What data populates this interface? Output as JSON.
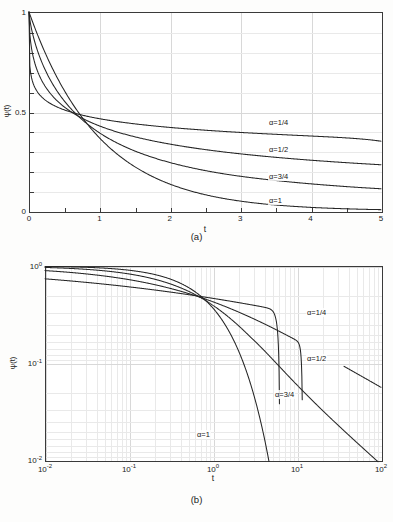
{
  "figure": {
    "background_color": "#fdfdfc",
    "curve_color": "#262626",
    "grid_color": "#d8d8d8",
    "axis_color": "#3a3a3a"
  },
  "panel_a": {
    "caption": "(a)",
    "xlabel": "t",
    "ylabel": "ψ(t)",
    "xticks": [
      "0",
      "1",
      "2",
      "3",
      "4",
      "5"
    ],
    "yticks": [
      "0",
      "0.5",
      "1"
    ],
    "curve_labels": [
      {
        "text": "α=1/4",
        "left": 268,
        "top": 120
      },
      {
        "text": "α=1/2",
        "left": 268,
        "top": 146
      },
      {
        "text": "α=3/4",
        "left": 268,
        "top": 173
      },
      {
        "text": "α=1",
        "left": 268,
        "top": 198
      }
    ]
  },
  "panel_b": {
    "caption": "(b)",
    "xlabel": "t",
    "ylabel": "ψ(t)",
    "xticks": [
      "10",
      "10",
      "10",
      "10",
      "10"
    ],
    "xtick_exponents": [
      "-2",
      "-1",
      "0",
      "1",
      "2"
    ],
    "yticks": [
      "10",
      "10",
      "10"
    ],
    "ytick_exponents": [
      "0",
      "-1",
      "-2"
    ],
    "curve_labels": [
      {
        "text": "α=1/4",
        "left": 306,
        "top": 310
      },
      {
        "text": "α=1/2",
        "left": 306,
        "top": 356
      },
      {
        "text": "α=3/4",
        "left": 274,
        "top": 392
      },
      {
        "text": "α=1",
        "left": 196,
        "top": 432
      }
    ]
  },
  "chart_data": [
    {
      "type": "line",
      "panel": "a",
      "title": "",
      "xlabel": "t",
      "ylabel": "ψ(t)",
      "xlim": [
        0,
        5
      ],
      "ylim": [
        0,
        1
      ],
      "xscale": "linear",
      "yscale": "linear",
      "grid": true,
      "legend_position": "inline-curve-labels",
      "x": [
        0,
        0.05,
        0.1,
        0.2,
        0.3,
        0.4,
        0.5,
        0.7,
        0.9,
        1.2,
        1.5,
        2.0,
        2.5,
        3.0,
        3.5,
        4.0,
        4.5,
        5.0
      ],
      "series": [
        {
          "name": "α=1/4",
          "values": [
            1.0,
            0.768,
            0.725,
            0.678,
            0.648,
            0.626,
            0.608,
            0.58,
            0.559,
            0.534,
            0.515,
            0.488,
            0.468,
            0.452,
            0.438,
            0.426,
            0.416,
            0.407
          ]
        },
        {
          "name": "α=1/2",
          "values": [
            1.0,
            0.806,
            0.734,
            0.654,
            0.6,
            0.559,
            0.527,
            0.479,
            0.444,
            0.404,
            0.375,
            0.337,
            0.31,
            0.289,
            0.273,
            0.259,
            0.248,
            0.238
          ]
        },
        {
          "name": "α=3/4",
          "values": [
            1.0,
            0.895,
            0.84,
            0.762,
            0.704,
            0.657,
            0.617,
            0.552,
            0.501,
            0.441,
            0.396,
            0.334,
            0.291,
            0.258,
            0.233,
            0.213,
            0.197,
            0.183
          ]
        },
        {
          "name": "α=1",
          "values": [
            1.0,
            0.951,
            0.905,
            0.819,
            0.741,
            0.67,
            0.607,
            0.497,
            0.407,
            0.301,
            0.223,
            0.135,
            0.082,
            0.05,
            0.03,
            0.018,
            0.011,
            0.0067
          ]
        }
      ],
      "annotations": [
        {
          "text": "α=1/4",
          "x": 3.7,
          "y": 0.41
        },
        {
          "text": "α=1/2",
          "x": 3.7,
          "y": 0.28
        },
        {
          "text": "α=3/4",
          "x": 3.7,
          "y": 0.16
        },
        {
          "text": "α=1",
          "x": 3.7,
          "y": 0.055
        }
      ],
      "notes": "All four curves start at ψ(0)=1 and intersect near t≈0.7, ψ≈0.47."
    },
    {
      "type": "line",
      "panel": "b",
      "title": "",
      "xlabel": "t",
      "ylabel": "ψ(t)",
      "xlim": [
        0.01,
        100
      ],
      "ylim": [
        0.01,
        1
      ],
      "xscale": "log",
      "yscale": "log",
      "grid": true,
      "legend_position": "inline-curve-labels",
      "x": [
        0.01,
        0.0316,
        0.1,
        0.316,
        0.7,
        1.0,
        3.16,
        10,
        31.6,
        100
      ],
      "series": [
        {
          "name": "α=1/4",
          "values": [
            0.805,
            0.76,
            0.725,
            0.64,
            0.56,
            0.518,
            0.432,
            0.36,
            0.295,
            0.232
          ]
        },
        {
          "name": "α=1/2",
          "values": [
            0.912,
            0.862,
            0.735,
            0.645,
            0.528,
            0.479,
            0.345,
            0.242,
            0.15,
            0.064
          ]
        },
        {
          "name": "α=3/4",
          "values": [
            0.985,
            0.965,
            0.84,
            0.7,
            0.552,
            0.48,
            0.275,
            0.133,
            0.054,
            0.0105
          ]
        },
        {
          "name": "α=1",
          "values": [
            0.99,
            0.969,
            0.905,
            0.729,
            0.497,
            0.368,
            0.0424,
            4.54e-05,
            null,
            null
          ]
        }
      ],
      "annotations": [
        {
          "text": "α=1/4",
          "x": 33,
          "y": 0.3
        },
        {
          "text": "α=1/2",
          "x": 33,
          "y": 0.115
        },
        {
          "text": "α=3/4",
          "x": 11,
          "y": 0.052
        },
        {
          "text": "α=1",
          "x": 2.0,
          "y": 0.028
        }
      ],
      "notes": "Log-log view: power-law tails of slope -α for α<1; α=1 falls exponentially and exits the axes near t≈5."
    }
  ]
}
